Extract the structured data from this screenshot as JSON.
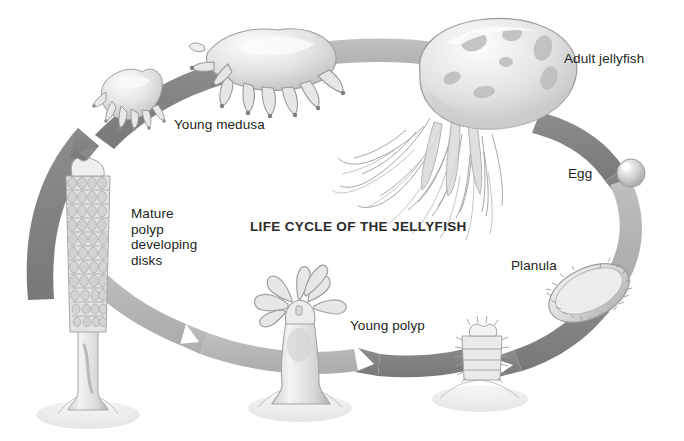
{
  "figure": {
    "title": "LIFE CYCLE OF THE JELLYFISH",
    "background_color": "#ffffff",
    "text_color": "#231f20",
    "arrow_color_dark": "#7f7f7f",
    "arrow_color_light": "#b5b5b5",
    "organism_fill": "#e9e9e9",
    "organism_shade": "#bfbfbf",
    "organism_outline": "#9a9a9a",
    "cycle_direction": "clockwise"
  },
  "labels": {
    "adult_jellyfish": "Adult jellyfish",
    "egg": "Egg",
    "planula": "Planula",
    "young_polyp": "Young polyp",
    "mature_polyp": "Mature\npolyp\ndeveloping\ndisks",
    "young_medusa": "Young medusa"
  },
  "stages": [
    {
      "id": "adult-jellyfish",
      "label": "Adult jellyfish",
      "order": 1,
      "x": 488,
      "y": 105
    },
    {
      "id": "egg",
      "label": "Egg",
      "order": 2,
      "x": 632,
      "y": 172
    },
    {
      "id": "planula",
      "label": "Planula",
      "order": 3,
      "x": 588,
      "y": 288
    },
    {
      "id": "settled-polyp",
      "label": "",
      "order": 4,
      "x": 480,
      "y": 363
    },
    {
      "id": "young-polyp",
      "label": "Young polyp",
      "order": 5,
      "x": 300,
      "y": 350
    },
    {
      "id": "mature-polyp",
      "label": "Mature polyp developing disks",
      "order": 6,
      "x": 88,
      "y": 280
    },
    {
      "id": "ephyra",
      "label": "",
      "order": 7,
      "x": 120,
      "y": 100
    },
    {
      "id": "young-medusa",
      "label": "Young medusa",
      "order": 8,
      "x": 268,
      "y": 70
    }
  ],
  "arrows": [
    {
      "id": "arrow-mature-to-ephyra",
      "from": "mature-polyp",
      "to": "ephyra",
      "tone": "dark"
    },
    {
      "id": "arrow-ephyra-to-medusa",
      "from": "ephyra",
      "to": "young-medusa",
      "tone": "dark"
    },
    {
      "id": "arrow-medusa-to-adult",
      "from": "young-medusa",
      "to": "adult-jellyfish",
      "tone": "light"
    },
    {
      "id": "arrow-adult-to-egg",
      "from": "adult-jellyfish",
      "to": "egg",
      "tone": "dark"
    },
    {
      "id": "arrow-egg-to-planula",
      "from": "egg",
      "to": "planula",
      "tone": "light"
    },
    {
      "id": "arrow-planula-to-settled",
      "from": "planula",
      "to": "settled-polyp",
      "tone": "dark"
    },
    {
      "id": "arrow-settled-to-young",
      "from": "settled-polyp",
      "to": "young-polyp",
      "tone": "dark"
    },
    {
      "id": "arrow-young-to-mature",
      "from": "young-polyp",
      "to": "mature-polyp",
      "tone": "light"
    }
  ]
}
